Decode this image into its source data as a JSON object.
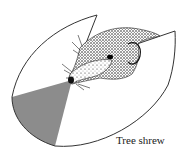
{
  "figure": {
    "subject": "Tree shrew",
    "caption": "Tree shrew",
    "colors": {
      "outline": "#333333",
      "binocular_field": "#8c8c8c",
      "background": "#ffffff",
      "head_ink": "#222222"
    }
  }
}
